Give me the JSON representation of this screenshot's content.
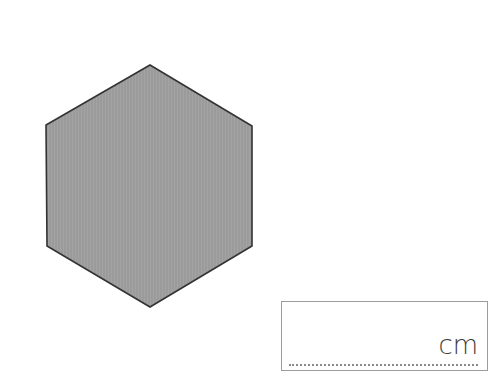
{
  "figure": {
    "shape": "regular-hexagon",
    "vertices": [
      [
        150,
        65
      ],
      [
        252,
        126
      ],
      [
        252,
        246
      ],
      [
        150,
        307
      ],
      [
        47,
        246
      ],
      [
        46,
        125
      ]
    ],
    "fill_color": "#9b9b9b",
    "stroke_color": "#333333"
  },
  "answer_box": {
    "value": "",
    "unit": "cm",
    "border_color": "#9c9c9c"
  }
}
